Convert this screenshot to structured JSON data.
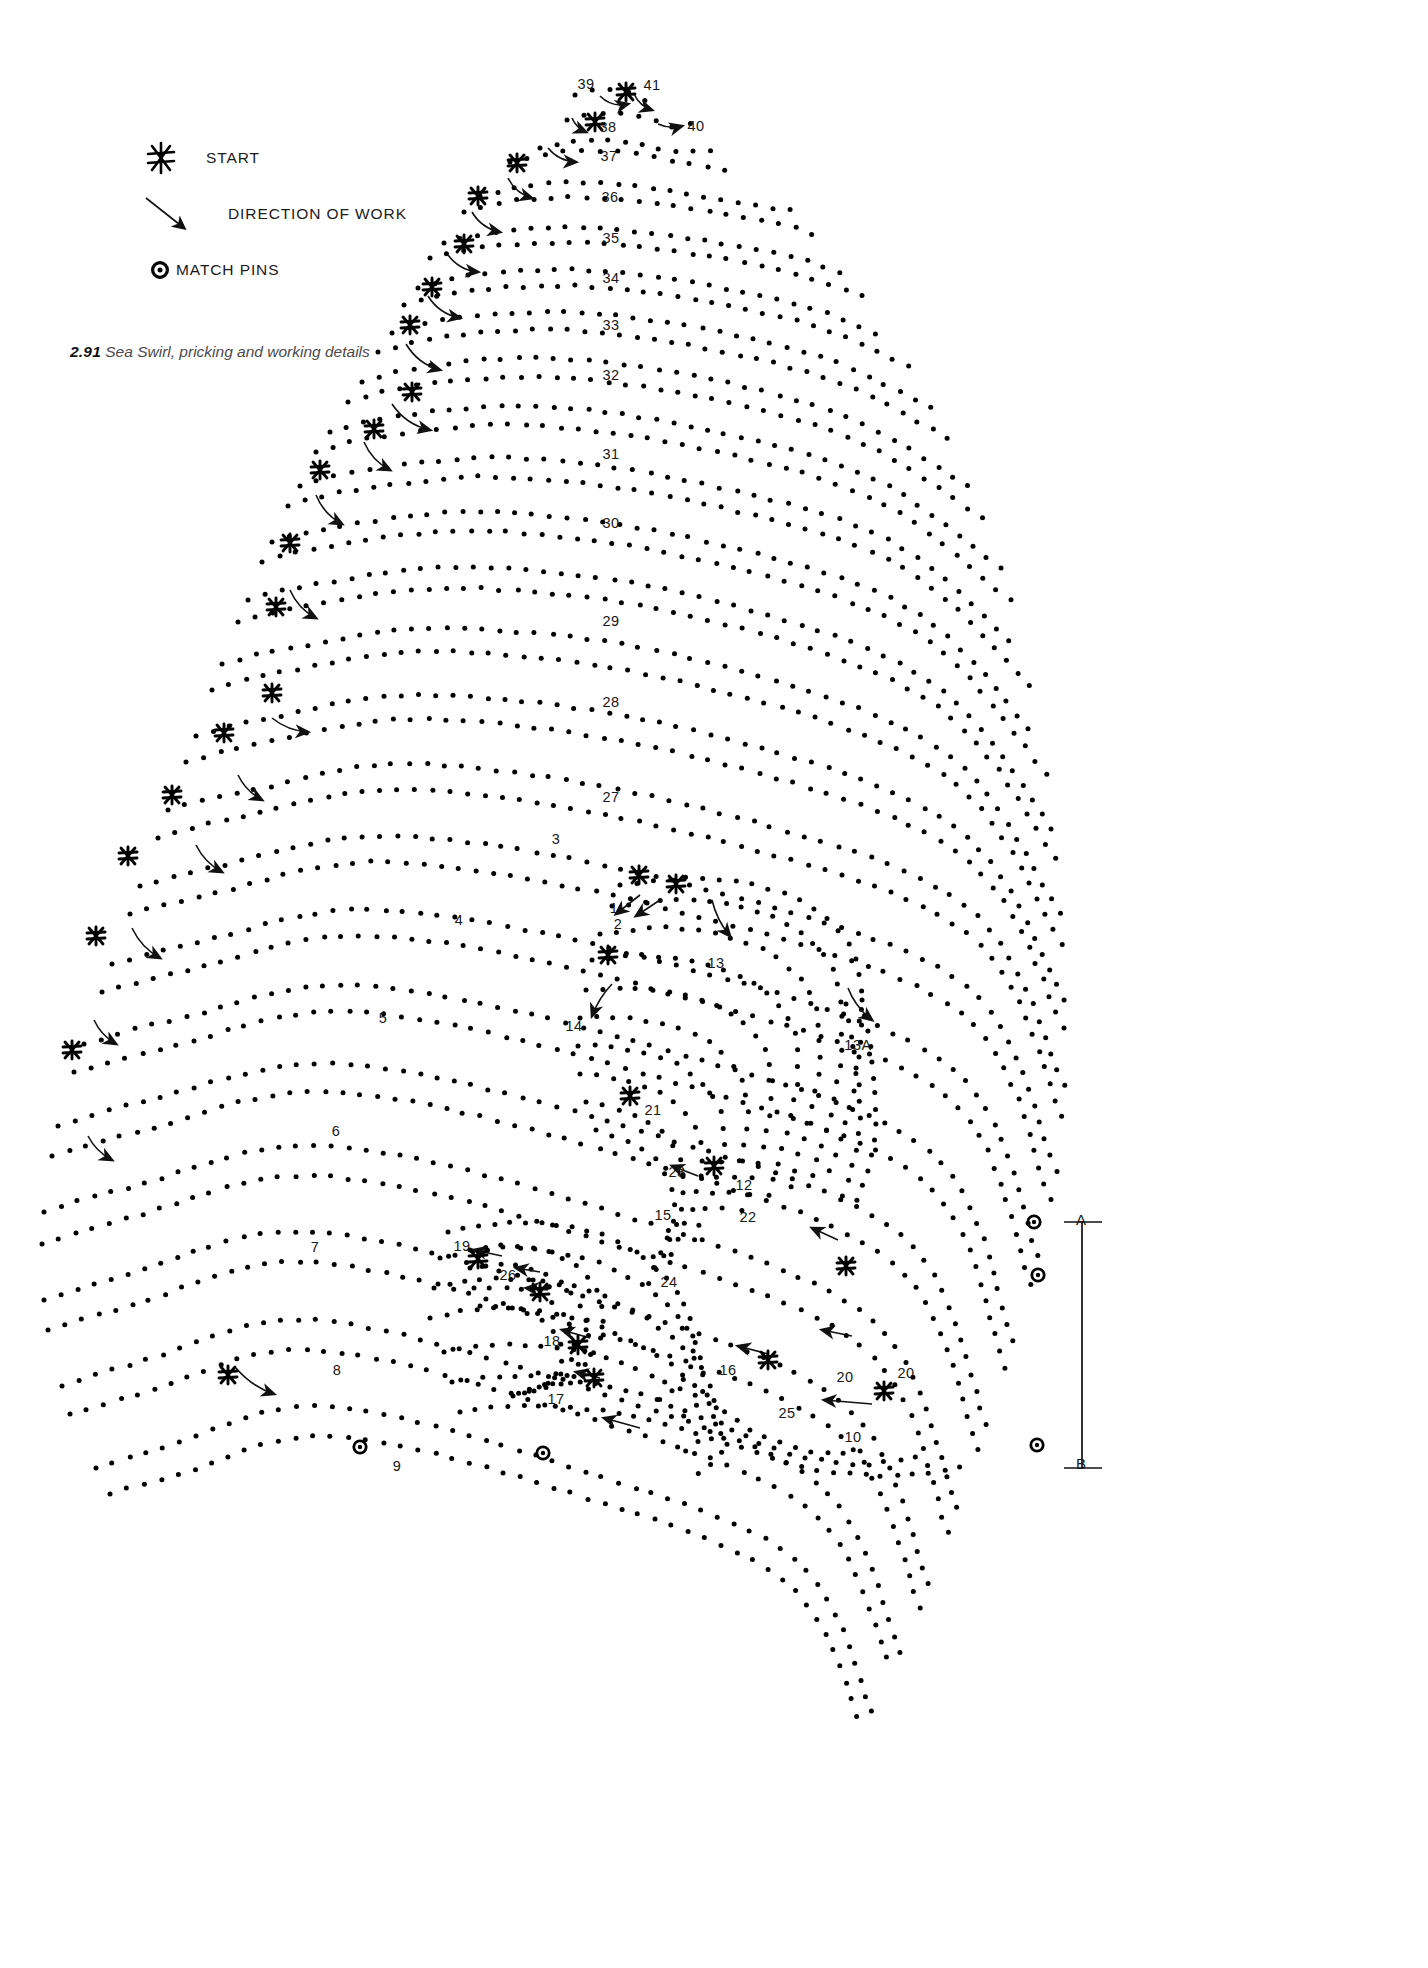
{
  "figure": {
    "caption_number": "2.91",
    "caption_text": "Sea Swirl, pricking and working details",
    "title": "Sea Swirl, pricking and working details"
  },
  "legend": {
    "items": [
      {
        "icon": "start-asterisk-icon",
        "label": "START"
      },
      {
        "icon": "direction-arrow-icon",
        "label": "DIRECTION OF WORK"
      },
      {
        "icon": "match-pin-icon",
        "label": "MATCH PINS"
      }
    ]
  },
  "section_labels": [
    {
      "text": "39",
      "x": 586,
      "y": 84
    },
    {
      "text": "41",
      "x": 652,
      "y": 85
    },
    {
      "text": "38",
      "x": 608,
      "y": 127
    },
    {
      "text": "40",
      "x": 696,
      "y": 126
    },
    {
      "text": "37",
      "x": 609,
      "y": 156
    },
    {
      "text": "36",
      "x": 610,
      "y": 197
    },
    {
      "text": "35",
      "x": 611,
      "y": 238
    },
    {
      "text": "34",
      "x": 611,
      "y": 278
    },
    {
      "text": "33",
      "x": 611,
      "y": 325
    },
    {
      "text": "32",
      "x": 611,
      "y": 375
    },
    {
      "text": "31",
      "x": 611,
      "y": 454
    },
    {
      "text": "30",
      "x": 611,
      "y": 523
    },
    {
      "text": "29",
      "x": 611,
      "y": 621
    },
    {
      "text": "28",
      "x": 611,
      "y": 702
    },
    {
      "text": "27",
      "x": 611,
      "y": 797
    },
    {
      "text": "3",
      "x": 556,
      "y": 839
    },
    {
      "text": "1",
      "x": 614,
      "y": 908
    },
    {
      "text": "2",
      "x": 618,
      "y": 924
    },
    {
      "text": "13",
      "x": 716,
      "y": 963
    },
    {
      "text": "4",
      "x": 459,
      "y": 920
    },
    {
      "text": "14",
      "x": 574,
      "y": 1026
    },
    {
      "text": "13A",
      "x": 858,
      "y": 1045
    },
    {
      "text": "5",
      "x": 383,
      "y": 1018
    },
    {
      "text": "21",
      "x": 653,
      "y": 1110
    },
    {
      "text": "6",
      "x": 336,
      "y": 1131
    },
    {
      "text": "23",
      "x": 677,
      "y": 1172
    },
    {
      "text": "12",
      "x": 744,
      "y": 1185
    },
    {
      "text": "15",
      "x": 663,
      "y": 1215
    },
    {
      "text": "22",
      "x": 748,
      "y": 1217
    },
    {
      "text": "19",
      "x": 462,
      "y": 1246
    },
    {
      "text": "7",
      "x": 315,
      "y": 1247
    },
    {
      "text": "26",
      "x": 508,
      "y": 1275
    },
    {
      "text": "24",
      "x": 669,
      "y": 1282
    },
    {
      "text": "18",
      "x": 552,
      "y": 1341
    },
    {
      "text": "16",
      "x": 728,
      "y": 1370
    },
    {
      "text": "20",
      "x": 845,
      "y": 1377
    },
    {
      "text": "20",
      "x": 906,
      "y": 1373
    },
    {
      "text": "8",
      "x": 337,
      "y": 1370
    },
    {
      "text": "17",
      "x": 556,
      "y": 1399
    },
    {
      "text": "25",
      "x": 787,
      "y": 1413
    },
    {
      "text": "10",
      "x": 853,
      "y": 1437
    },
    {
      "text": "9",
      "x": 397,
      "y": 1466
    }
  ],
  "range_markers": [
    {
      "text": "A",
      "x": 1081,
      "y": 1219
    },
    {
      "text": "B",
      "x": 1081,
      "y": 1463
    }
  ],
  "match_pins": [
    {
      "x": 1034,
      "y": 1222
    },
    {
      "x": 1038,
      "y": 1275
    },
    {
      "x": 1037,
      "y": 1445
    },
    {
      "x": 360,
      "y": 1447
    },
    {
      "x": 543,
      "y": 1453
    }
  ],
  "colors": {
    "ink": "#111111",
    "caption": "#4a4a4a",
    "background": "#ffffff"
  }
}
